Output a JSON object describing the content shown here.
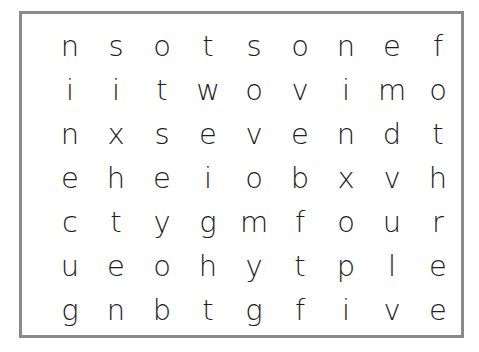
{
  "puzzle": {
    "type": "word-search",
    "rows": 7,
    "cols": 9,
    "grid": [
      [
        "n",
        "s",
        "o",
        "t",
        "s",
        "o",
        "n",
        "e",
        "f"
      ],
      [
        "i",
        "i",
        "t",
        "w",
        "o",
        "v",
        "i",
        "m",
        "o"
      ],
      [
        "n",
        "x",
        "s",
        "e",
        "v",
        "e",
        "n",
        "d",
        "t"
      ],
      [
        "e",
        "h",
        "e",
        "i",
        "o",
        "b",
        "x",
        "v",
        "h"
      ],
      [
        "c",
        "t",
        "y",
        "g",
        "m",
        "f",
        "o",
        "u",
        "r"
      ],
      [
        "u",
        "e",
        "o",
        "h",
        "y",
        "t",
        "p",
        "l",
        "e"
      ],
      [
        "g",
        "n",
        "b",
        "t",
        "g",
        "f",
        "i",
        "v",
        "e"
      ]
    ],
    "border_color": "#8a8a8a",
    "text_color": "#1e1e1e"
  }
}
